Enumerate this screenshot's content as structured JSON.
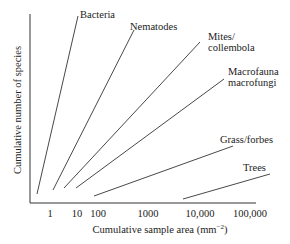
{
  "chart_data": {
    "type": "line",
    "title": "",
    "xlabel": "Cumulative sample area (mm",
    "xlabel_sup": "−2",
    "xlabel_close": ")",
    "ylabel": "Cumulative number of species",
    "x_scale": "log",
    "x_ticks": [
      "1",
      "10",
      "100",
      "1000",
      "10,000",
      "100,000"
    ],
    "y_ticks": [],
    "grid": false,
    "legend": "direct labels at line ends",
    "series": [
      {
        "name": "Bacteria",
        "label_lines": [
          "Bacteria"
        ],
        "x_start": 0.3,
        "x_end": 10,
        "y_start_rel": 0.05,
        "y_end_rel": 1.0
      },
      {
        "name": "Nematodes",
        "label_lines": [
          "Nematodes"
        ],
        "x_start": 1.5,
        "x_end": 400,
        "y_start_rel": 0.08,
        "y_end_rel": 0.92
      },
      {
        "name": "Mites/collembola",
        "label_lines": [
          "Mites/",
          "collembola"
        ],
        "x_start": 4,
        "x_end": 8000,
        "y_start_rel": 0.09,
        "y_end_rel": 0.86
      },
      {
        "name": "Macrofauna macrofungi",
        "label_lines": [
          "Macrofauna",
          "macrofungi"
        ],
        "x_start": 10,
        "x_end": 20000,
        "y_start_rel": 0.09,
        "y_end_rel": 0.66
      },
      {
        "name": "Grass/forbes",
        "label_lines": [
          "Grass/forbes"
        ],
        "x_start": 60,
        "x_end": 40000,
        "y_start_rel": 0.04,
        "y_end_rel": 0.3
      },
      {
        "name": "Trees",
        "label_lines": [
          "Trees"
        ],
        "x_start": 5000,
        "x_end": 200000,
        "y_start_rel": 0.02,
        "y_end_rel": 0.15
      }
    ]
  },
  "geometry": {
    "axes": {
      "x0": 30,
      "y0": 203,
      "x1": 256,
      "ytop": 14
    },
    "lines": [
      {
        "x1": 37,
        "y1": 194,
        "x2": 78,
        "y2": 16
      },
      {
        "x1": 53,
        "y1": 190,
        "x2": 134,
        "y2": 30
      },
      {
        "x1": 64,
        "y1": 188,
        "x2": 200,
        "y2": 42
      },
      {
        "x1": 76,
        "y1": 188,
        "x2": 224,
        "y2": 79
      },
      {
        "x1": 94,
        "y1": 196,
        "x2": 233,
        "y2": 146
      },
      {
        "x1": 183,
        "y1": 199,
        "x2": 270,
        "y2": 174
      }
    ],
    "labels": [
      {
        "x": 80,
        "y": 9
      },
      {
        "x": 130,
        "y": 21
      },
      {
        "x": 208,
        "y": 31
      },
      {
        "x": 228,
        "y": 66
      },
      {
        "x": 220,
        "y": 134
      },
      {
        "x": 243,
        "y": 162
      }
    ],
    "tick_x": [
      50,
      77,
      98,
      148,
      200,
      250
    ],
    "tick_y": 208
  },
  "colors": {
    "line": "#333333",
    "axis": "#333333",
    "text": "#222222"
  }
}
